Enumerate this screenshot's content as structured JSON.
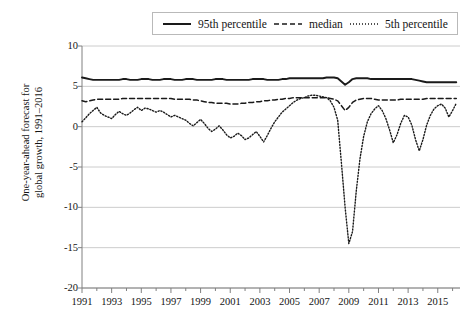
{
  "figure": {
    "background": "#ffffff",
    "gridline_color": "#cccccc",
    "axis_color": "#808080",
    "series_color": "#1a1a1a"
  },
  "legend": {
    "position": "top",
    "entries": [
      {
        "label": "95th percentile",
        "style": "solid",
        "icon": "solid-line-icon"
      },
      {
        "label": "median",
        "style": "dashed",
        "icon": "dashed-line-icon"
      },
      {
        "label": "5th percentile",
        "style": "dotted",
        "icon": "dotted-line-icon"
      }
    ]
  },
  "axes": {
    "ylabel_line1": "One-year-ahead forecast for",
    "ylabel_line2": "global growth, 1991–2016",
    "xlabel": "",
    "yticks": [
      "10",
      "5",
      "0",
      "-5",
      "-10",
      "-15",
      "-20"
    ],
    "xticks": [
      "1991",
      "1993",
      "1995",
      "1997",
      "1999",
      "2001",
      "2003",
      "2005",
      "2007",
      "2009",
      "2011",
      "2013",
      "2015"
    ]
  },
  "chart_data": {
    "type": "line",
    "title": "",
    "xlabel": "",
    "ylabel": "One-year-ahead forecast for global growth, 1991–2016",
    "xlim": [
      1991,
      2016.5
    ],
    "ylim": [
      -20,
      10
    ],
    "yticks": [
      10,
      5,
      0,
      -5,
      -10,
      -15,
      -20
    ],
    "xticks": [
      1991,
      1993,
      1995,
      1997,
      1999,
      2001,
      2003,
      2005,
      2007,
      2009,
      2011,
      2013,
      2015
    ],
    "grid": true,
    "legend_position": "top",
    "x_step": 0.25,
    "series": [
      {
        "name": "95th percentile",
        "style": "solid",
        "x_start": 1991,
        "values": [
          6.1,
          6.0,
          5.9,
          5.8,
          5.8,
          5.8,
          5.8,
          5.8,
          5.8,
          5.8,
          5.8,
          5.9,
          5.9,
          5.8,
          5.8,
          5.8,
          5.9,
          5.9,
          5.9,
          5.8,
          5.8,
          5.8,
          5.9,
          5.9,
          5.9,
          5.8,
          5.8,
          5.8,
          5.9,
          5.9,
          5.9,
          5.8,
          5.8,
          5.8,
          5.8,
          5.8,
          5.9,
          5.9,
          5.9,
          5.8,
          5.8,
          5.8,
          5.8,
          5.8,
          5.8,
          5.8,
          5.9,
          5.9,
          5.9,
          5.9,
          5.8,
          5.8,
          5.8,
          5.8,
          5.9,
          5.9,
          6.0,
          6.0,
          6.0,
          6.0,
          6.0,
          6.0,
          6.0,
          6.0,
          6.0,
          6.0,
          6.1,
          6.1,
          6.1,
          6.0,
          5.6,
          5.2,
          5.5,
          5.9,
          6.0,
          6.0,
          6.0,
          6.0,
          5.9,
          5.9,
          5.9,
          5.9,
          5.9,
          5.9,
          5.9,
          5.9,
          5.9,
          5.9,
          5.9,
          5.9,
          5.8,
          5.7,
          5.6,
          5.5,
          5.5,
          5.5,
          5.5,
          5.5,
          5.5,
          5.5,
          5.5,
          5.5
        ]
      },
      {
        "name": "median",
        "style": "dashed",
        "x_start": 1991,
        "values": [
          3.2,
          3.1,
          3.2,
          3.3,
          3.4,
          3.4,
          3.4,
          3.4,
          3.4,
          3.4,
          3.4,
          3.5,
          3.5,
          3.5,
          3.5,
          3.5,
          3.5,
          3.5,
          3.5,
          3.5,
          3.5,
          3.5,
          3.5,
          3.5,
          3.5,
          3.4,
          3.4,
          3.4,
          3.4,
          3.4,
          3.3,
          3.3,
          3.2,
          3.1,
          3.0,
          3.0,
          2.9,
          2.9,
          2.9,
          2.9,
          2.8,
          2.8,
          2.8,
          2.9,
          2.9,
          3.0,
          3.0,
          3.1,
          3.1,
          3.2,
          3.2,
          3.3,
          3.3,
          3.4,
          3.4,
          3.5,
          3.5,
          3.6,
          3.6,
          3.6,
          3.6,
          3.6,
          3.6,
          3.6,
          3.6,
          3.6,
          3.6,
          3.5,
          3.4,
          3.2,
          2.6,
          2.0,
          2.4,
          3.0,
          3.3,
          3.4,
          3.5,
          3.5,
          3.5,
          3.4,
          3.3,
          3.3,
          3.3,
          3.3,
          3.3,
          3.3,
          3.4,
          3.4,
          3.4,
          3.4,
          3.4,
          3.4,
          3.4,
          3.5,
          3.5,
          3.5,
          3.5,
          3.5,
          3.5,
          3.5,
          3.5,
          3.5
        ]
      },
      {
        "name": "5th percentile",
        "style": "dotted",
        "x_start": 1991,
        "values": [
          0.6,
          1.1,
          1.6,
          2.0,
          2.4,
          1.7,
          1.4,
          1.2,
          1.0,
          1.5,
          1.9,
          1.6,
          1.4,
          1.7,
          2.1,
          2.4,
          2.0,
          2.3,
          2.2,
          2.0,
          1.8,
          2.0,
          1.8,
          1.5,
          1.2,
          1.4,
          1.2,
          1.0,
          0.8,
          0.4,
          0.1,
          0.5,
          0.9,
          0.4,
          -0.2,
          -0.6,
          -0.3,
          0.1,
          -0.4,
          -1.0,
          -1.4,
          -1.2,
          -0.8,
          -1.1,
          -1.6,
          -1.4,
          -1.0,
          -0.6,
          -1.2,
          -1.9,
          -1.1,
          -0.2,
          0.6,
          1.2,
          1.8,
          2.2,
          2.6,
          3.0,
          3.3,
          3.5,
          3.6,
          3.8,
          3.9,
          3.9,
          3.8,
          3.7,
          3.6,
          3.2,
          2.4,
          0.8,
          -4.5,
          -10.0,
          -14.5,
          -13.0,
          -8.0,
          -4.0,
          -1.2,
          0.6,
          1.6,
          2.2,
          2.6,
          2.0,
          1.0,
          -0.4,
          -2.0,
          -1.0,
          0.4,
          1.4,
          1.2,
          0.2,
          -1.6,
          -3.0,
          -1.6,
          0.2,
          1.4,
          2.2,
          2.6,
          2.8,
          2.3,
          1.2,
          2.0,
          2.9
        ]
      }
    ]
  }
}
